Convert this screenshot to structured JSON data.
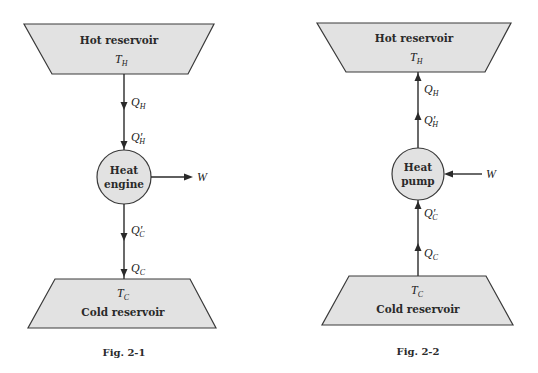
{
  "figures": [
    {
      "id": "fig-2-1",
      "caption": "Fig. 2-1",
      "hot_reservoir": {
        "label": "Hot reservoir",
        "temp_symbol": "T",
        "temp_sub": "H"
      },
      "device": {
        "line1": "Heat",
        "line2": "engine"
      },
      "work": {
        "symbol": "W",
        "direction": "out"
      },
      "heat_flow_direction": "down",
      "upper_flows": [
        {
          "symbol": "Q",
          "prime": "",
          "sub": "H"
        },
        {
          "symbol": "Q",
          "prime": "′",
          "sub": "H"
        }
      ],
      "lower_flows": [
        {
          "symbol": "Q",
          "prime": "′",
          "sub": "C"
        },
        {
          "symbol": "Q",
          "prime": "",
          "sub": "C"
        }
      ],
      "cold_reservoir": {
        "label": "Cold reservoir",
        "temp_symbol": "T",
        "temp_sub": "C"
      }
    },
    {
      "id": "fig-2-2",
      "caption": "Fig. 2-2",
      "hot_reservoir": {
        "label": "Hot reservoir",
        "temp_symbol": "T",
        "temp_sub": "H"
      },
      "device": {
        "line1": "Heat",
        "line2": "pump"
      },
      "work": {
        "symbol": "W",
        "direction": "in"
      },
      "heat_flow_direction": "up",
      "upper_flows": [
        {
          "symbol": "Q",
          "prime": "",
          "sub": "H"
        },
        {
          "symbol": "Q",
          "prime": "′",
          "sub": "H"
        }
      ],
      "lower_flows": [
        {
          "symbol": "Q",
          "prime": "′",
          "sub": "C"
        },
        {
          "symbol": "Q",
          "prime": "",
          "sub": "C"
        }
      ],
      "cold_reservoir": {
        "label": "Cold reservoir",
        "temp_symbol": "T",
        "temp_sub": "C"
      }
    }
  ]
}
